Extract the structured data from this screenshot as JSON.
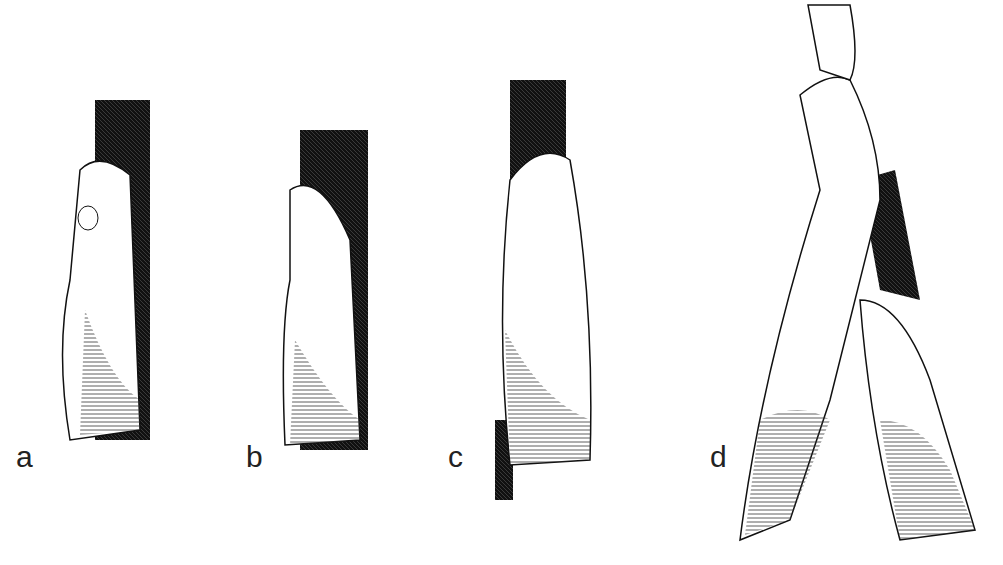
{
  "figure": {
    "panels": [
      {
        "label": "a",
        "subject": "hand jam with thumb tucked, crack on right"
      },
      {
        "label": "b",
        "subject": "hand jam with cupped fingers in crack"
      },
      {
        "label": "c",
        "subject": "flat hand jam, fingers up in dark crack"
      },
      {
        "label": "d",
        "subject": "two arms, hand reaching up and hand jammed below"
      }
    ]
  }
}
